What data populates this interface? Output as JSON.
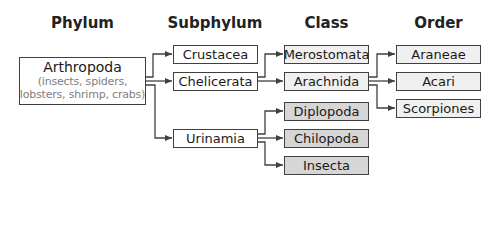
{
  "headers": {
    "phylum": "Phylum",
    "subphylum": "Subphylum",
    "class": "Class",
    "order": "Order"
  },
  "phylum": {
    "name": "Arthropoda",
    "description_line1": "(insects, spiders,",
    "description_line2": "lobsters, shrimp, crabs)"
  },
  "subphyla": [
    {
      "name": "Crustacea"
    },
    {
      "name": "Chelicerata"
    },
    {
      "name": "Urinamia"
    }
  ],
  "classes": [
    {
      "name": "Merostomata",
      "parent": "Chelicerata",
      "shade": "light"
    },
    {
      "name": "Arachnida",
      "parent": "Chelicerata",
      "shade": "light"
    },
    {
      "name": "Diplopoda",
      "parent": "Urinamia",
      "shade": "dark"
    },
    {
      "name": "Chilopoda",
      "parent": "Urinamia",
      "shade": "dark"
    },
    {
      "name": "Insecta",
      "parent": "Urinamia",
      "shade": "dark"
    }
  ],
  "orders": [
    {
      "name": "Araneae",
      "parent": "Arachnida"
    },
    {
      "name": "Acari",
      "parent": "Arachnida"
    },
    {
      "name": "Scorpiones",
      "parent": "Arachnida"
    }
  ],
  "colors": {
    "border": "#404040",
    "light_fill": "#f0f0f0",
    "dark_fill": "#d6d6d6",
    "connector": "#404040"
  }
}
